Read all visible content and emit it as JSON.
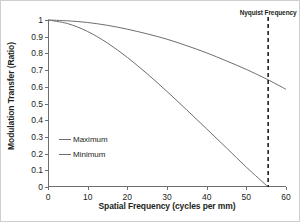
{
  "chart_data": {
    "type": "line",
    "title": "",
    "xlabel": "Spatial Frequency (cycles per mm)",
    "ylabel": "Modulation Transfer (Ratio)",
    "xlim": [
      0,
      60
    ],
    "ylim": [
      0,
      1
    ],
    "xticks": [
      0,
      10,
      20,
      30,
      40,
      50,
      60
    ],
    "xtick_labels": [
      "0",
      "10",
      "20",
      "30",
      "40",
      "50",
      "60"
    ],
    "yticks": [
      0,
      0.1,
      0.2,
      0.3,
      0.4,
      0.5,
      0.6,
      0.7,
      0.8,
      0.9,
      1
    ],
    "ytick_labels": [
      "0",
      "0.1",
      "0.2",
      "0.3",
      "0.4",
      "0.5",
      "0.6",
      "0.7",
      "0.8",
      "0.9",
      "1"
    ],
    "grid": false,
    "legend_position": "center-left",
    "line_color": "#6d6e71",
    "annotation_color": "#231f20",
    "series": [
      {
        "name": "Maximum",
        "x": [
          0,
          5,
          10,
          15,
          20,
          25,
          30,
          35,
          40,
          45,
          50,
          55,
          55.5,
          60
        ],
        "values": [
          1.0,
          0.995,
          0.985,
          0.968,
          0.945,
          0.917,
          0.885,
          0.846,
          0.803,
          0.755,
          0.704,
          0.648,
          0.642,
          0.585
        ]
      },
      {
        "name": "Minimum",
        "x": [
          0,
          5,
          10,
          15,
          20,
          25,
          30,
          35,
          40,
          45,
          50,
          55.5
        ],
        "values": [
          1.0,
          0.978,
          0.931,
          0.862,
          0.776,
          0.678,
          0.572,
          0.461,
          0.348,
          0.234,
          0.119,
          0.0
        ]
      }
    ],
    "annotations": [
      {
        "label": "Nyquist Frequency",
        "type": "vline",
        "x": 55.5,
        "style": "dashed"
      }
    ]
  },
  "legend": {
    "items": [
      {
        "label": "Maximum"
      },
      {
        "label": "Minimum"
      }
    ]
  }
}
